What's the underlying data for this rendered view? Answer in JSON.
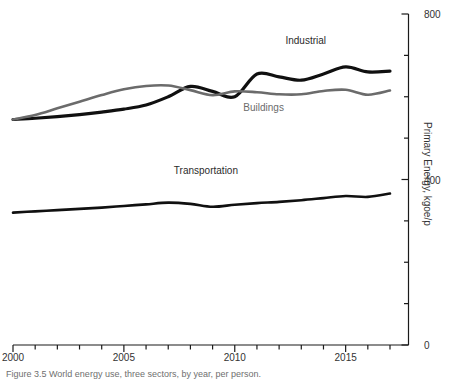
{
  "chart_data": {
    "type": "line",
    "title": "",
    "xlabel": "",
    "ylabel": "Primary Energy, kgoe/p",
    "xlim": [
      2000,
      2017
    ],
    "ylim": [
      0,
      800
    ],
    "ytick_values": [
      0,
      400,
      800
    ],
    "ytick_labels": [
      "0",
      "400",
      "800"
    ],
    "yminor_step": 100,
    "xtick_values": [
      2000,
      2005,
      2010,
      2015
    ],
    "xtick_labels": [
      "2000",
      "2005",
      "2010",
      "2015"
    ],
    "xminor_step": 1,
    "grid": false,
    "legend_position": "inline-labels",
    "x": [
      2000,
      2001,
      2002,
      2003,
      2004,
      2005,
      2006,
      2007,
      2008,
      2009,
      2010,
      2011,
      2012,
      2013,
      2014,
      2015,
      2016,
      2017
    ],
    "series": [
      {
        "name": "Industrial",
        "color": "#101010",
        "width": 3.2,
        "label_x": 2013.2,
        "label_y": 735,
        "values": [
          545,
          548,
          552,
          557,
          563,
          570,
          580,
          600,
          625,
          613,
          600,
          655,
          648,
          640,
          655,
          672,
          660,
          662
        ]
      },
      {
        "name": "Buildings",
        "color": "#6b6b6b",
        "width": 2.6,
        "label_x": 2011.3,
        "label_y": 572,
        "values": [
          545,
          556,
          572,
          588,
          604,
          618,
          626,
          627,
          616,
          604,
          613,
          611,
          606,
          606,
          614,
          617,
          605,
          615
        ]
      },
      {
        "name": "Transportation",
        "color": "#101010",
        "width": 2.6,
        "label_x": 2008.7,
        "label_y": 420,
        "values": [
          320,
          323,
          326,
          329,
          332,
          336,
          340,
          344,
          341,
          334,
          339,
          343,
          346,
          350,
          355,
          360,
          358,
          366
        ]
      }
    ]
  },
  "caption": {
    "text": "Figure 3.5  World energy use, three sectors, by year, per person."
  }
}
